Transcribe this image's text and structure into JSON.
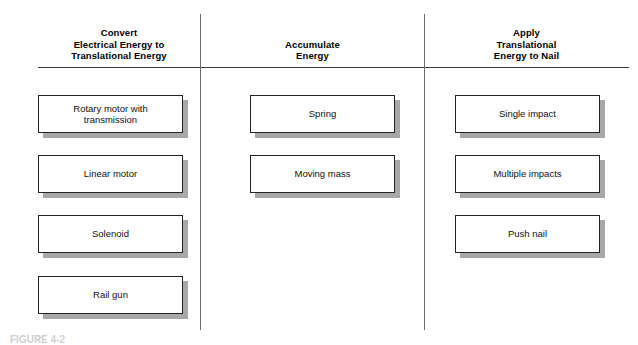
{
  "figure": {
    "caption": "FIGURE 4-2",
    "columns": [
      {
        "id": "convert-electrical-to-translational",
        "header_lines": [
          "Convert",
          "Electrical Energy to",
          "Translational Energy"
        ],
        "options": [
          {
            "label_lines": [
              "Rotary motor with",
              "transmission"
            ]
          },
          {
            "label_lines": [
              "Linear motor"
            ]
          },
          {
            "label_lines": [
              "Solenoid"
            ]
          },
          {
            "label_lines": [
              "Rail gun"
            ]
          }
        ]
      },
      {
        "id": "accumulate-energy",
        "header_lines": [
          "Accumulate",
          "Energy"
        ],
        "options": [
          {
            "label_lines": [
              "Spring"
            ]
          },
          {
            "label_lines": [
              "Moving mass"
            ]
          }
        ]
      },
      {
        "id": "apply-translational-energy-to-nail",
        "header_lines": [
          "Apply",
          "Translational",
          "Energy to Nail"
        ],
        "options": [
          {
            "label_lines": [
              "Single impact"
            ]
          },
          {
            "label_lines": [
              "Multiple impacts"
            ]
          },
          {
            "label_lines": [
              "Push nail"
            ]
          }
        ]
      }
    ]
  },
  "colors": {
    "box_border": "#242424",
    "box_fill": "#ffffff",
    "box_shadow": "#a8a8a8",
    "rule": "#3a3a3a",
    "divider": "#6e6e6e",
    "text": "#111111"
  }
}
